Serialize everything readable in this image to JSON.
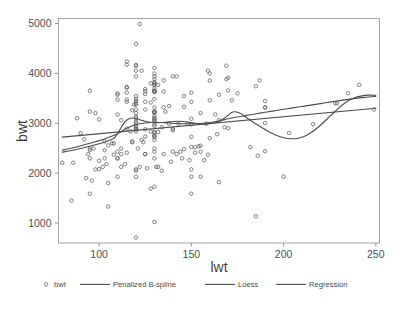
{
  "chart_data": {
    "type": "scatter",
    "title": "",
    "xlabel": "lwt",
    "ylabel": "bwt",
    "xlim": [
      78,
      252
    ],
    "ylim": [
      600,
      5100
    ],
    "xticks": [
      100,
      150,
      200,
      250
    ],
    "yticks": [
      1000,
      2000,
      3000,
      4000,
      5000
    ],
    "xtick_labels": [
      "100",
      "150",
      "200",
      "250"
    ],
    "ytick_labels": [
      "1000",
      "2000",
      "3000",
      "4000",
      "5000"
    ],
    "grid": false,
    "legend_position": "bottom-center",
    "marker": "open-circle",
    "point_color": "#5b5b5b",
    "line_color": "#4d4d4d",
    "frame_color": "#9a9a9a",
    "background": "#ffffff",
    "series": [
      {
        "name": "bwt",
        "kind": "scatter",
        "points": [
          [
            182,
            2523
          ],
          [
            155,
            2551
          ],
          [
            105,
            2557
          ],
          [
            108,
            2594
          ],
          [
            107,
            2600
          ],
          [
            124,
            2622
          ],
          [
            118,
            2637
          ],
          [
            103,
            2637
          ],
          [
            123,
            2663
          ],
          [
            130,
            2665
          ],
          [
            130,
            2722
          ],
          [
            125,
            2733
          ],
          [
            130,
            2751
          ],
          [
            130,
            2756
          ],
          [
            130,
            2807
          ],
          [
            132,
            2827
          ],
          [
            130,
            2828
          ],
          [
            128,
            2835
          ],
          [
            117,
            2836
          ],
          [
            120,
            2840
          ],
          [
            140,
            2860
          ],
          [
            120,
            2877
          ],
          [
            125,
            2877
          ],
          [
            140,
            2885
          ],
          [
            120,
            2892
          ],
          [
            115,
            2892
          ],
          [
            120,
            2920
          ],
          [
            134,
            2920
          ],
          [
            120,
            2948
          ],
          [
            130,
            2948
          ],
          [
            150,
            2977
          ],
          [
            130,
            2977
          ],
          [
            120,
            3005
          ],
          [
            120,
            3033
          ],
          [
            130,
            3042
          ],
          [
            130,
            3062
          ],
          [
            112,
            3062
          ],
          [
            100,
            3076
          ],
          [
            130,
            3090
          ],
          [
            150,
            3090
          ],
          [
            120,
            3100
          ],
          [
            130,
            3104
          ],
          [
            120,
            3132
          ],
          [
            130,
            3147
          ],
          [
            110,
            3175
          ],
          [
            120,
            3203
          ],
          [
            130,
            3203
          ],
          [
            155,
            3203
          ],
          [
            98,
            3203
          ],
          [
            130,
            3225
          ],
          [
            136,
            3232
          ],
          [
            95,
            3232
          ],
          [
            130,
            3232
          ],
          [
            130,
            3234
          ],
          [
            118,
            3260
          ],
          [
            120,
            3274
          ],
          [
            125,
            3274
          ],
          [
            190,
            3317
          ],
          [
            130,
            3317
          ],
          [
            190,
            3317
          ],
          [
            135,
            3317
          ],
          [
            146,
            3331
          ],
          [
            138,
            3345
          ],
          [
            120,
            3374
          ],
          [
            119,
            3374
          ],
          [
            120,
            3402
          ],
          [
            128,
            3416
          ],
          [
            115,
            3430
          ],
          [
            125,
            3430
          ],
          [
            150,
            3430
          ],
          [
            120,
            3444
          ],
          [
            160,
            3459
          ],
          [
            110,
            3473
          ],
          [
            115,
            3473
          ],
          [
            130,
            3487
          ],
          [
            120,
            3487
          ],
          [
            120,
            3544
          ],
          [
            146,
            3544
          ],
          [
            165,
            3572
          ],
          [
            110,
            3572
          ],
          [
            125,
            3586
          ],
          [
            110,
            3600
          ],
          [
            115,
            3614
          ],
          [
            150,
            3614
          ],
          [
            130,
            3629
          ],
          [
            130,
            3629
          ],
          [
            135,
            3637
          ],
          [
            125,
            3643
          ],
          [
            130,
            3651
          ],
          [
            95,
            3651
          ],
          [
            130,
            3651
          ],
          [
            170,
            3657
          ],
          [
            125,
            3685
          ],
          [
            130,
            3699
          ],
          [
            115,
            3713
          ],
          [
            115,
            3728
          ],
          [
            130,
            3770
          ],
          [
            132,
            3770
          ],
          [
            130,
            3770
          ],
          [
            130,
            3799
          ],
          [
            128,
            3799
          ],
          [
            130,
            3827
          ],
          [
            160,
            3856
          ],
          [
            135,
            3860
          ],
          [
            187,
            3860
          ],
          [
            130,
            3884
          ],
          [
            169,
            3884
          ],
          [
            170,
            3912
          ],
          [
            140,
            3940
          ],
          [
            142,
            3940
          ],
          [
            120,
            3941
          ],
          [
            130,
            3941
          ],
          [
            160,
            3997
          ],
          [
            130,
            3997
          ],
          [
            123,
            4054
          ],
          [
            159,
            4054
          ],
          [
            120,
            4054
          ],
          [
            130,
            4111
          ],
          [
            120,
            4153
          ],
          [
            169,
            4153
          ],
          [
            120,
            4167
          ],
          [
            115,
            4174
          ],
          [
            115,
            4238
          ],
          [
            120,
            4593
          ],
          [
            122,
            4990
          ],
          [
            86,
            2208
          ],
          [
            80,
            2208
          ],
          [
            130,
            1021
          ],
          [
            120,
            709
          ],
          [
            95,
            1588
          ],
          [
            105,
            1330
          ],
          [
            85,
            1452
          ],
          [
            120,
            1928
          ],
          [
            150,
            1928
          ],
          [
            165,
            1819
          ],
          [
            130,
            1729
          ],
          [
            128,
            1690
          ],
          [
            155,
            1928
          ],
          [
            150,
            1588
          ],
          [
            185,
            1135
          ],
          [
            200,
            1928
          ],
          [
            120,
            2075
          ],
          [
            150,
            2075
          ],
          [
            100,
            2082
          ],
          [
            98,
            2075
          ],
          [
            102,
            2126
          ],
          [
            122,
            2126
          ],
          [
            112,
            2126
          ],
          [
            131,
            2126
          ],
          [
            132,
            2126
          ],
          [
            110,
            1928
          ],
          [
            145,
            2296
          ],
          [
            110,
            2296
          ],
          [
            130,
            2296
          ],
          [
            110,
            2296
          ],
          [
            95,
            2296
          ],
          [
            103,
            2296
          ],
          [
            135,
            2381
          ],
          [
            125,
            2381
          ],
          [
            125,
            2381
          ],
          [
            142,
            2381
          ],
          [
            112,
            2381
          ],
          [
            94,
            2381
          ],
          [
            115,
            2410
          ],
          [
            152,
            2410
          ],
          [
            110,
            2430
          ],
          [
            155,
            2430
          ],
          [
            130,
            2430
          ],
          [
            140,
            2430
          ],
          [
            190,
            2440
          ],
          [
            186,
            2350
          ],
          [
            103,
            2460
          ],
          [
            95,
            2460
          ],
          [
            95,
            2495
          ],
          [
            97,
            2495
          ],
          [
            130,
            2495
          ],
          [
            121,
            2495
          ],
          [
            112,
            2495
          ],
          [
            150,
            2523
          ],
          [
            170,
            2900
          ],
          [
            168,
            2920
          ],
          [
            216,
            2980
          ],
          [
            190,
            3005
          ],
          [
            203,
            2807
          ],
          [
            229,
            3400
          ],
          [
            235,
            3600
          ],
          [
            241,
            3770
          ],
          [
            249,
            3275
          ],
          [
            228,
            3402
          ],
          [
            190,
            3445
          ],
          [
            185,
            3742
          ],
          [
            175,
            3600
          ],
          [
            172,
            3459
          ],
          [
            165,
            3062
          ],
          [
            163,
            3175
          ],
          [
            158,
            2990
          ],
          [
            148,
            2990
          ],
          [
            143,
            2990
          ],
          [
            138,
            2990
          ],
          [
            160,
            2700
          ],
          [
            152,
            2520
          ],
          [
            146,
            2480
          ],
          [
            157,
            2260
          ],
          [
            150,
            2730
          ],
          [
            120,
            2050
          ],
          [
            105,
            1800
          ],
          [
            100,
            2250
          ],
          [
            92,
            2680
          ],
          [
            90,
            2800
          ],
          [
            88,
            3100
          ],
          [
            93,
            1900
          ],
          [
            96,
            1850
          ],
          [
            104,
            2180
          ],
          [
            108,
            2370
          ],
          [
            114,
            2180
          ],
          [
            118,
            2620
          ],
          [
            126,
            2100
          ],
          [
            134,
            2050
          ],
          [
            139,
            2230
          ],
          [
            144,
            2430
          ],
          [
            149,
            2260
          ],
          [
            154,
            2540
          ],
          [
            159,
            2370
          ],
          [
            164,
            2780
          ]
        ]
      },
      {
        "name": "Penalized B-spline",
        "kind": "line",
        "points": [
          [
            80,
            2420
          ],
          [
            85,
            2455
          ],
          [
            90,
            2495
          ],
          [
            95,
            2540
          ],
          [
            100,
            2590
          ],
          [
            105,
            2650
          ],
          [
            108,
            2700
          ],
          [
            110,
            2790
          ],
          [
            112,
            2920
          ],
          [
            114,
            3030
          ],
          [
            116,
            3085
          ],
          [
            118,
            3105
          ],
          [
            120,
            3095
          ],
          [
            123,
            3060
          ],
          [
            126,
            3030
          ],
          [
            129,
            3015
          ],
          [
            132,
            3012
          ],
          [
            136,
            3020
          ],
          [
            140,
            3035
          ],
          [
            144,
            3040
          ],
          [
            148,
            3025
          ],
          [
            152,
            3000
          ],
          [
            156,
            2985
          ],
          [
            160,
            2990
          ],
          [
            164,
            3020
          ],
          [
            167,
            3080
          ],
          [
            170,
            3160
          ],
          [
            172,
            3220
          ],
          [
            174,
            3230
          ],
          [
            177,
            3190
          ],
          [
            180,
            3110
          ],
          [
            184,
            3010
          ],
          [
            188,
            2920
          ],
          [
            192,
            2830
          ],
          [
            196,
            2760
          ],
          [
            200,
            2710
          ],
          [
            204,
            2690
          ],
          [
            208,
            2700
          ],
          [
            212,
            2750
          ],
          [
            216,
            2840
          ],
          [
            220,
            2960
          ],
          [
            224,
            3100
          ],
          [
            228,
            3240
          ],
          [
            232,
            3370
          ],
          [
            236,
            3470
          ],
          [
            240,
            3530
          ],
          [
            244,
            3560
          ],
          [
            247,
            3565
          ],
          [
            250,
            3560
          ]
        ]
      },
      {
        "name": "Loess",
        "kind": "line",
        "points": [
          [
            80,
            2460
          ],
          [
            86,
            2510
          ],
          [
            92,
            2570
          ],
          [
            98,
            2630
          ],
          [
            104,
            2700
          ],
          [
            110,
            2790
          ],
          [
            114,
            2880
          ],
          [
            118,
            2950
          ],
          [
            122,
            2990
          ],
          [
            126,
            3010
          ],
          [
            130,
            3020
          ],
          [
            134,
            3015
          ],
          [
            138,
            3005
          ],
          [
            142,
            2995
          ],
          [
            146,
            2990
          ],
          [
            150,
            2990
          ],
          [
            154,
            2995
          ],
          [
            158,
            3005
          ],
          [
            162,
            3025
          ],
          [
            166,
            3055
          ],
          [
            170,
            3090
          ],
          [
            174,
            3120
          ],
          [
            178,
            3145
          ],
          [
            182,
            3170
          ],
          [
            186,
            3195
          ],
          [
            190,
            3220
          ],
          [
            196,
            3255
          ],
          [
            202,
            3290
          ],
          [
            208,
            3325
          ],
          [
            214,
            3360
          ],
          [
            220,
            3395
          ],
          [
            226,
            3430
          ],
          [
            232,
            3465
          ],
          [
            238,
            3495
          ],
          [
            244,
            3520
          ],
          [
            250,
            3540
          ]
        ]
      },
      {
        "name": "Regression",
        "kind": "line",
        "points": [
          [
            80,
            2722
          ],
          [
            250,
            3300
          ]
        ]
      }
    ],
    "legend": [
      {
        "label": "bwt",
        "symbol": "open-circle"
      },
      {
        "label": "Penalized B-spline",
        "symbol": "line"
      },
      {
        "label": "Loess",
        "symbol": "line"
      },
      {
        "label": "Regression",
        "symbol": "line"
      }
    ]
  },
  "labels": {
    "xlabel": "lwt",
    "ylabel": "bwt"
  }
}
